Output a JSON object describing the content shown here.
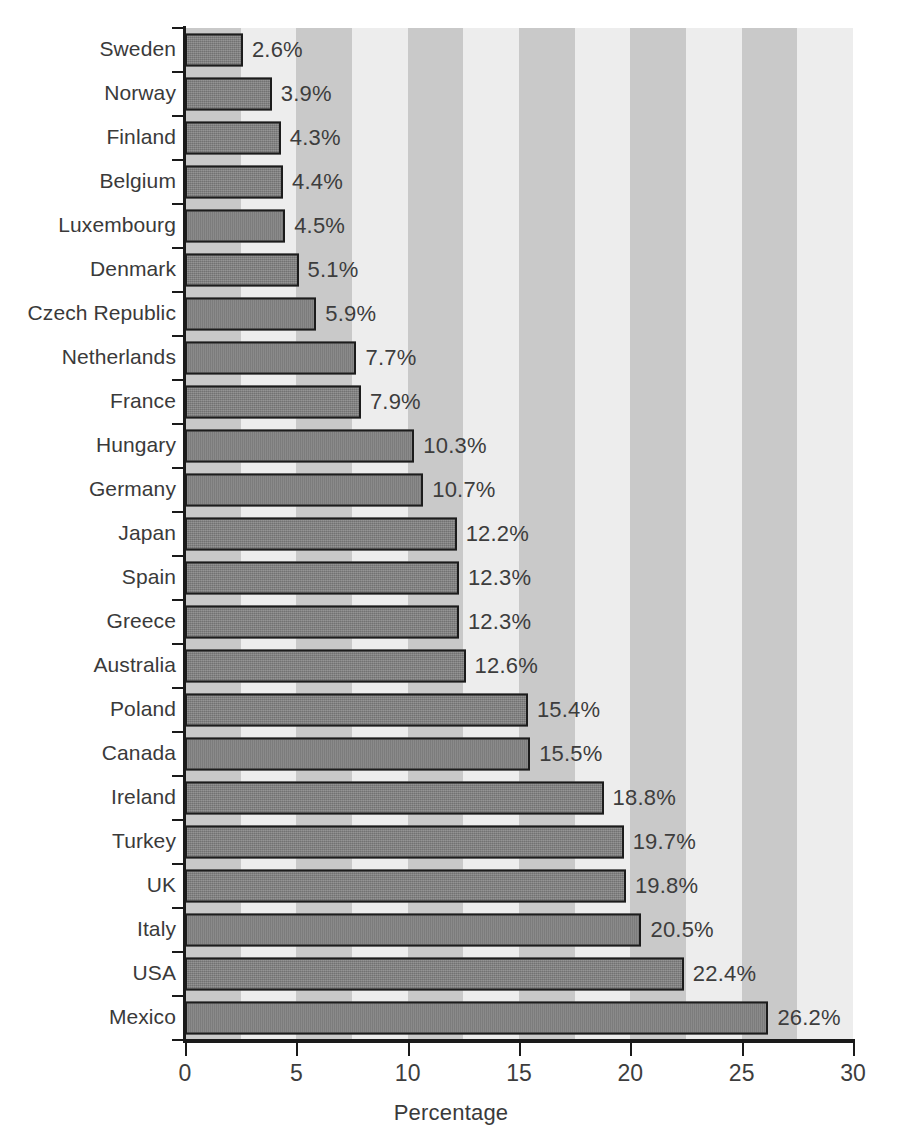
{
  "chart_data": {
    "type": "bar",
    "orientation": "horizontal",
    "title": "",
    "xlabel": "Percentage",
    "ylabel": "",
    "xlim": [
      0,
      30
    ],
    "xticks": [
      0,
      5,
      10,
      15,
      20,
      25,
      30
    ],
    "xtick_labels": [
      "0",
      "5",
      "10",
      "15",
      "20",
      "25",
      "30"
    ],
    "grid": false,
    "legend": null,
    "band_interval": 2.5,
    "categories": [
      "Sweden",
      "Norway",
      "Finland",
      "Belgium",
      "Luxembourg",
      "Denmark",
      "Czech Republic",
      "Netherlands",
      "France",
      "Hungary",
      "Germany",
      "Japan",
      "Spain",
      "Greece",
      "Australia",
      "Poland",
      "Canada",
      "Ireland",
      "Turkey",
      "UK",
      "Italy",
      "USA",
      "Mexico"
    ],
    "values": [
      2.6,
      3.9,
      4.3,
      4.4,
      4.5,
      5.1,
      5.9,
      7.7,
      7.9,
      10.3,
      10.7,
      12.2,
      12.3,
      12.3,
      12.6,
      15.4,
      15.5,
      18.8,
      19.7,
      19.8,
      20.5,
      22.4,
      26.2
    ],
    "data_labels": [
      "2.6%",
      "3.9%",
      "4.3%",
      "4.4%",
      "4.5%",
      "5.1%",
      "5.9%",
      "7.7%",
      "7.9%",
      "10.3%",
      "10.7%",
      "12.2%",
      "12.3%",
      "12.3%",
      "12.6%",
      "15.4%",
      "15.5%",
      "18.8%",
      "19.7%",
      "19.8%",
      "20.5%",
      "22.4%",
      "26.2%"
    ]
  },
  "colors": {
    "bar_fill": "#7f7f7f",
    "bar_stroke": "#1c1c1c",
    "band_light": "#ededed",
    "band_dark": "#c9c9c9",
    "axis": "#1a1a1a",
    "text": "#3a3a3a",
    "background": "#ffffff"
  }
}
